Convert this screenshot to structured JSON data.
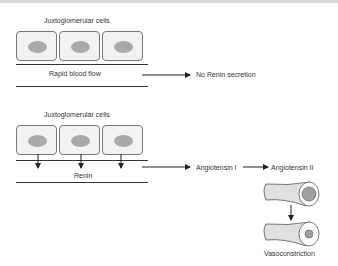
{
  "panel_top": {
    "cells_label": "Juxtoglomerular cells",
    "flow_label": "Rapid blood flow",
    "result_label": "No Renin secretion"
  },
  "panel_bottom": {
    "cells_label": "Juxtoglomerular cells",
    "secretion_label": "Renin",
    "step1_label": "Angiotensin I",
    "step2_label": "Angiotensin II",
    "outcome_label": "Vasoconstriction"
  },
  "colors": {
    "cell_fill": "#f2f2f2",
    "nucleus": "#a9a9a9",
    "line": "#333333",
    "vessel_fill": "#e0e0e0",
    "lumen": "#a0a0a0"
  }
}
